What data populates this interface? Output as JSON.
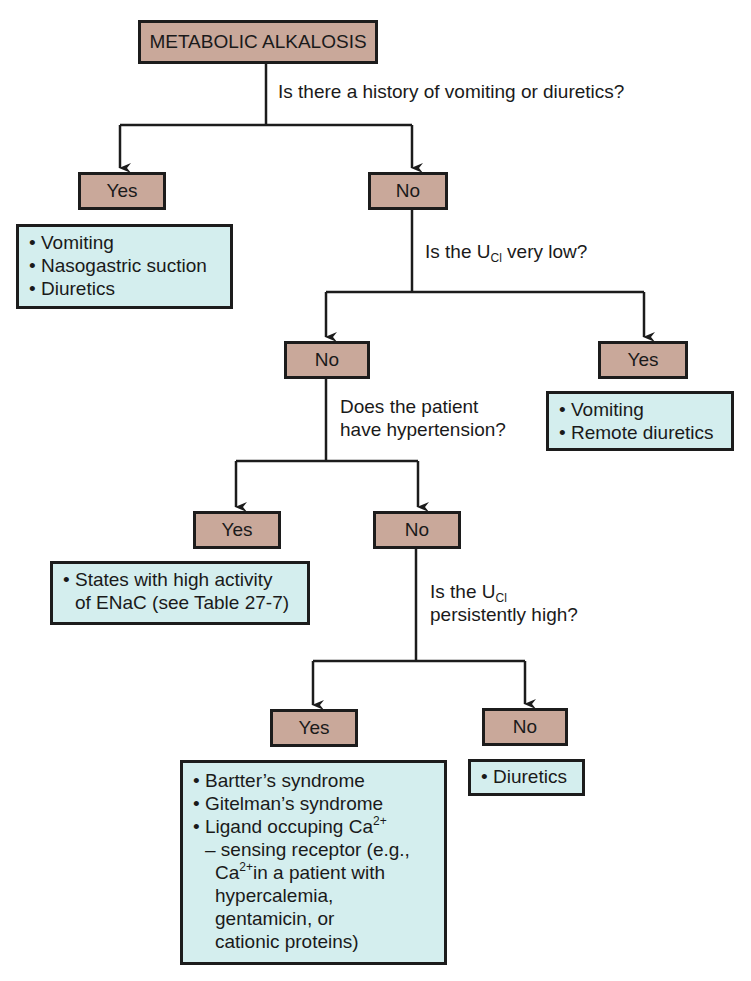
{
  "colors": {
    "decision_fill": "#c9a89a",
    "result_fill": "#d4eeee",
    "line": "#1c1c1c"
  },
  "root": {
    "label": "METABOLIC ALKALOSIS"
  },
  "q1": {
    "text": "Is there a history of vomiting or diuretics?"
  },
  "q1_yes": {
    "label": "Yes",
    "results": [
      "Vomiting",
      "Nasogastric suction",
      "Diuretics"
    ]
  },
  "q1_no": {
    "label": "No"
  },
  "q2": {
    "prefix": "Is the U",
    "sub": "Cl",
    "suffix": " very low?"
  },
  "q2_yes": {
    "label": "Yes",
    "results": [
      "Vomiting",
      "Remote diuretics"
    ]
  },
  "q2_no": {
    "label": "No"
  },
  "q3": {
    "line1": "Does the patient",
    "line2": "have hypertension?"
  },
  "q3_yes": {
    "label": "Yes",
    "result_line1": "States with high activity",
    "result_line2": "of ENaC (see Table 27-7)"
  },
  "q3_no": {
    "label": "No"
  },
  "q4": {
    "prefix": "Is the U",
    "sub": "Cl",
    "line2": "persistently high?"
  },
  "q4_yes": {
    "label": "Yes",
    "results": [
      "Bartter’s syndrome",
      "Gitelman’s syndrome"
    ],
    "ligand_line": "Ligand occuping Ca",
    "ligand_sup": "2+",
    "sensing_line": "– sensing receptor (e.g.,",
    "ca_prefix": "Ca",
    "ca_sup": "2+",
    "ca_rest": "in a patient with",
    "tail_lines": [
      "hypercalemia,",
      "gentamicin, or",
      "cationic proteins)"
    ]
  },
  "q4_no": {
    "label": "No",
    "results": [
      "Diuretics"
    ]
  }
}
